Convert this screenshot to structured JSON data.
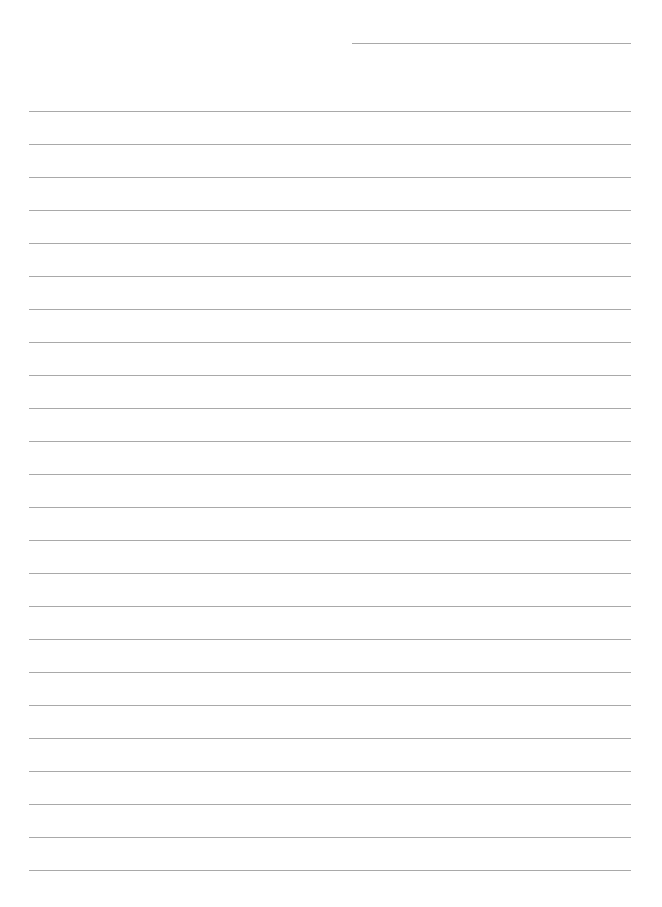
{
  "page": {
    "type": "lined-paper",
    "background": "#ffffff",
    "line_color": "#9a9a9a",
    "header_line": {
      "x1": 352,
      "x2": 631,
      "y": 43
    },
    "ruled_lines": {
      "count": 24,
      "x1": 29,
      "x2": 631,
      "first_y": 111,
      "spacing": 33
    }
  }
}
